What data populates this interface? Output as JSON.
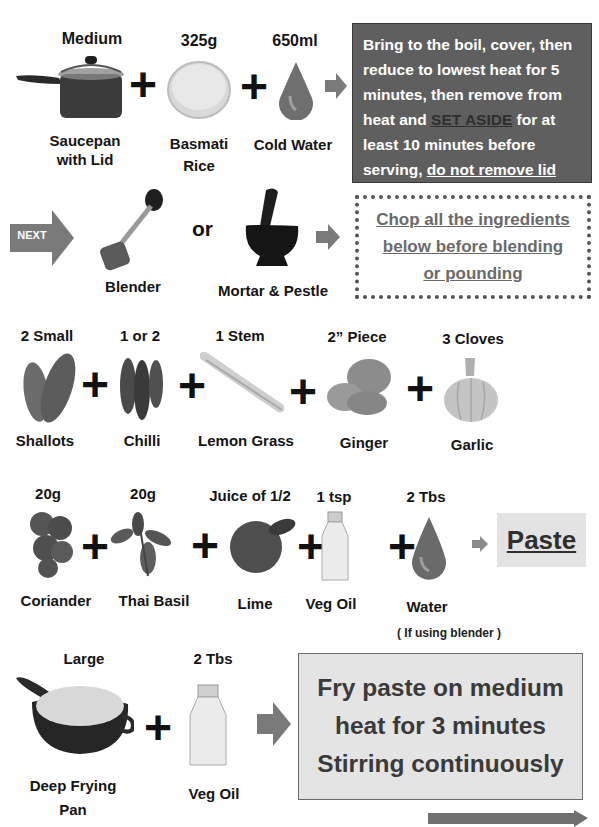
{
  "step1": {
    "items": [
      {
        "quantity": "Medium",
        "name_line1": "Saucepan",
        "name_line2": "with Lid",
        "icon": "saucepan-icon"
      },
      {
        "quantity": "325g",
        "name_line1": "Basmati",
        "name_line2": "Rice",
        "icon": "rice-icon"
      },
      {
        "quantity": "650ml",
        "name_line1": "Cold Water",
        "name_line2": "",
        "icon": "water-drop-icon"
      }
    ],
    "instruction": {
      "part1": "Bring to the boil, cover, then reduce to lowest heat for 5 minutes, then remove from heat and ",
      "emphasis": "SET ASIDE",
      "part2": " for at least 10 minutes before serving, ",
      "underlined": "do not remove lid"
    }
  },
  "step2": {
    "next_label": "NEXT",
    "or_label": "or",
    "tools": [
      {
        "name": "Blender",
        "icon": "blender-icon"
      },
      {
        "name": "Mortar & Pestle",
        "icon": "mortar-pestle-icon"
      }
    ],
    "instruction_lines": [
      "Chop all the ingredients",
      "below before blending",
      "or pounding"
    ]
  },
  "step3": {
    "items": [
      {
        "quantity": "2 Small",
        "name": "Shallots",
        "icon": "shallots-icon"
      },
      {
        "quantity": "1 or 2",
        "name": "Chilli",
        "icon": "chilli-icon"
      },
      {
        "quantity": "1 Stem",
        "name": "Lemon Grass",
        "icon": "lemongrass-icon"
      },
      {
        "quantity": "2” Piece",
        "name": "Ginger",
        "icon": "ginger-icon"
      },
      {
        "quantity": "3 Cloves",
        "name": "Garlic",
        "icon": "garlic-icon"
      }
    ]
  },
  "step4": {
    "items": [
      {
        "quantity": "20g",
        "name": "Coriander",
        "icon": "coriander-icon"
      },
      {
        "quantity": "20g",
        "name": "Thai Basil",
        "icon": "thai-basil-icon"
      },
      {
        "quantity": "Juice of 1/2",
        "name": "Lime",
        "icon": "lime-icon"
      },
      {
        "quantity": "1 tsp",
        "name": "Veg Oil",
        "icon": "oil-bottle-icon"
      },
      {
        "quantity": "2 Tbs",
        "name": "Water",
        "icon": "water-drop-icon"
      }
    ],
    "water_note": "( If using blender )",
    "result": "Paste"
  },
  "step5": {
    "items": [
      {
        "quantity": "Large",
        "name_line1": "Deep Frying",
        "name_line2": "Pan",
        "icon": "frying-pan-icon"
      },
      {
        "quantity": "2 Tbs",
        "name_line1": "Veg Oil",
        "name_line2": "",
        "icon": "oil-bottle-icon"
      }
    ],
    "instruction_lines": [
      "Fry paste on medium",
      "heat for 3 minutes",
      "Stirring continuously"
    ]
  },
  "colors": {
    "arrow_gray": "#7a7a7a",
    "dark_box": "#5f5f5f",
    "light_box": "#e4e4e4",
    "dotted_text": "#6a6a6a"
  }
}
